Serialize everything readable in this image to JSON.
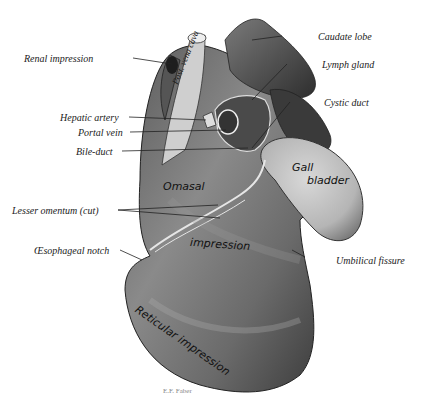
{
  "figure": {
    "signature": "E.F. Faber"
  },
  "labels": {
    "renal_impression": "Renal impression",
    "post_vena_cava": "Post. vena cava",
    "caudate_lobe": "Caudate lobe",
    "lymph_gland": "Lymph gland",
    "cystic_duct": "Cystic duct",
    "hepatic_artery": "Hepatic artery",
    "portal_vein": "Portal vein",
    "bile_duct": "Bile-duct",
    "gall_bladder_1": "Gall",
    "gall_bladder_2": "bladder",
    "omasal": "Omasal",
    "lesser_omentum": "Lesser omentum (cut)",
    "impression": "impression",
    "oesophageal_notch": "Œsophageal notch",
    "umbilical_fissure": "Umbilical fissure",
    "reticular_impression": "Reticular impression"
  },
  "colors": {
    "organ_dark": "#3a3a3a",
    "organ_mid": "#6e6e6e",
    "organ_light": "#a9a9a9",
    "gall_bladder": "#c4c4c4",
    "leader_line": "#222222"
  }
}
